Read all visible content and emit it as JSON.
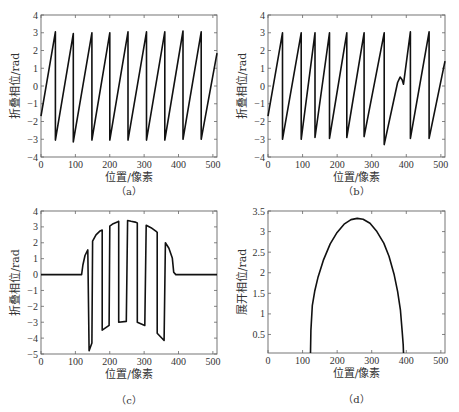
{
  "figure": {
    "panels": [
      "a",
      "b",
      "c",
      "d"
    ]
  },
  "chart_data": [
    {
      "id": "a",
      "type": "line",
      "caption": "（a）",
      "xlabel": "位置/像素",
      "ylabel": "折叠相位/rad",
      "xlim": [
        0,
        512
      ],
      "ylim": [
        -4,
        4
      ],
      "xticks": [
        0,
        100,
        200,
        300,
        400,
        500
      ],
      "yticks": [
        -4,
        -3,
        -2,
        -1,
        0,
        1,
        2,
        3,
        4
      ],
      "grid": false,
      "box": {
        "left": 41,
        "top": 15,
        "right": 217,
        "bottom": 157
      },
      "description": "Wrapped (folded) phase sawtooth, wraps between -pi and +pi roughly every 54 px",
      "x": [
        0,
        42,
        42,
        94,
        94,
        148,
        148,
        200,
        200,
        253,
        253,
        307,
        307,
        360,
        360,
        413,
        413,
        466,
        466,
        512
      ],
      "y": [
        -1.7,
        3.05,
        -3.05,
        2.95,
        -3.15,
        3.0,
        -3.05,
        3.0,
        -3.05,
        3.05,
        -3.05,
        3.05,
        -3.05,
        3.05,
        -3.05,
        3.1,
        -3.0,
        3.05,
        -3.0,
        1.85
      ]
    },
    {
      "id": "b",
      "type": "line",
      "caption": "（b）",
      "xlabel": "位置/像素",
      "ylabel": "折叠相位/rad",
      "xlim": [
        0,
        512
      ],
      "ylim": [
        -4,
        4
      ],
      "xticks": [
        0,
        100,
        200,
        300,
        400,
        500
      ],
      "yticks": [
        -4,
        -3,
        -2,
        -1,
        0,
        1,
        2,
        3,
        4
      ],
      "grid": false,
      "box": {
        "left": 268,
        "top": 15,
        "right": 445,
        "bottom": 157
      },
      "description": "Wrapped phase with noise disturbance near x≈380 (small bump) before wrapping",
      "x": [
        0,
        42,
        42,
        96,
        96,
        136,
        136,
        178,
        178,
        228,
        228,
        278,
        278,
        336,
        336,
        375,
        382,
        388,
        392,
        412,
        412,
        466,
        466,
        512
      ],
      "y": [
        -1.7,
        3.0,
        -3.0,
        3.0,
        -3.0,
        3.0,
        -2.9,
        3.0,
        -2.95,
        3.0,
        -2.9,
        3.0,
        -2.85,
        3.0,
        -3.3,
        0.2,
        0.5,
        0.35,
        0.1,
        3.05,
        -2.95,
        3.05,
        -2.95,
        1.4
      ]
    },
    {
      "id": "c",
      "type": "line",
      "caption": "（c）",
      "xlabel": "位置/像素",
      "ylabel": "折叠相位/rad",
      "xlim": [
        0,
        512
      ],
      "ylim": [
        -5,
        4
      ],
      "xticks": [
        0,
        100,
        200,
        300,
        400,
        500
      ],
      "yticks": [
        -5,
        -4,
        -3,
        -2,
        -1,
        0,
        1,
        2,
        3,
        4
      ],
      "grid": false,
      "box": {
        "left": 41,
        "top": 211,
        "right": 217,
        "bottom": 354
      },
      "description": "Folded phase of a hemispherical object: flat zero outside, rectangular-ish wraps within 120–390 px",
      "x": [
        0,
        118,
        122,
        128,
        136,
        140,
        148,
        150,
        160,
        172,
        178,
        178,
        198,
        200,
        210,
        222,
        226,
        226,
        248,
        252,
        262,
        274,
        280,
        280,
        302,
        306,
        320,
        336,
        338,
        338,
        358,
        362,
        372,
        382,
        386,
        392,
        512
      ],
      "y": [
        0,
        0,
        0.6,
        1.2,
        1.55,
        -4.8,
        -4.3,
        2.1,
        2.5,
        2.75,
        2.8,
        -3.5,
        -3.2,
        3.05,
        3.2,
        3.3,
        3.35,
        -3.0,
        -2.95,
        3.4,
        3.35,
        3.3,
        3.25,
        -3.0,
        -3.2,
        3.1,
        2.95,
        2.7,
        2.65,
        -3.7,
        -4.15,
        2.0,
        1.65,
        1.05,
        0.15,
        0,
        0
      ]
    },
    {
      "id": "d",
      "type": "line",
      "caption": "（d）",
      "xlabel": "位置/像素",
      "ylabel": "展开相位/rad",
      "xlim": [
        0,
        512
      ],
      "ylim": [
        0.05,
        3.5
      ],
      "xticks": [
        0,
        100,
        200,
        300,
        400,
        500
      ],
      "yticks": [
        0.5,
        1,
        1.5,
        2,
        2.5,
        3,
        3.5
      ],
      "grid": false,
      "box": {
        "left": 268,
        "top": 211,
        "right": 445,
        "bottom": 353
      },
      "description": "Unwrapped phase: semi-elliptical dome from ~123 to ~392 px, peak ≈3.32 rad near x≈258",
      "x": [
        123,
        124,
        128,
        135,
        145,
        160,
        180,
        200,
        220,
        240,
        258,
        275,
        295,
        315,
        335,
        350,
        365,
        375,
        383,
        388,
        391,
        392
      ],
      "y": [
        0.05,
        0.6,
        1.2,
        1.55,
        1.9,
        2.3,
        2.7,
        2.98,
        3.18,
        3.29,
        3.32,
        3.3,
        3.2,
        3.0,
        2.72,
        2.4,
        1.95,
        1.55,
        1.1,
        0.6,
        0.25,
        0.05
      ]
    }
  ]
}
